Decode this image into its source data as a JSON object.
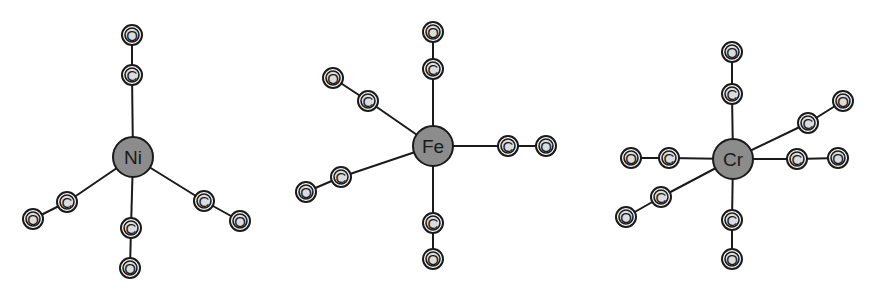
{
  "diagram": {
    "colors": {
      "metal_fill": "#8c8c8c",
      "ligand_fill": "#dcdcdc",
      "outline": "#1a1a1a",
      "background": "#ffffff"
    },
    "molecules": [
      {
        "name": "nickel-tetracarbonyl",
        "metal": {
          "label": "Ni",
          "x": 133,
          "y": 157,
          "r": 20
        },
        "ligands": [
          {
            "c": {
              "label": "C",
              "x": 132,
              "y": 75
            },
            "o": {
              "label": "O",
              "x": 132,
              "y": 35
            }
          },
          {
            "c": {
              "label": "C",
              "x": 67,
              "y": 202
            },
            "o": {
              "label": "O",
              "x": 33,
              "y": 219
            }
          },
          {
            "c": {
              "label": "C",
              "x": 131,
              "y": 228
            },
            "o": {
              "label": "O",
              "x": 130,
              "y": 268
            }
          },
          {
            "c": {
              "label": "C",
              "x": 204,
              "y": 201
            },
            "o": {
              "label": "O",
              "x": 240,
              "y": 221
            }
          }
        ]
      },
      {
        "name": "iron-pentacarbonyl",
        "metal": {
          "label": "Fe",
          "x": 433,
          "y": 146,
          "r": 20
        },
        "ligands": [
          {
            "c": {
              "label": "C",
              "x": 433,
              "y": 69
            },
            "o": {
              "label": "O",
              "x": 433,
              "y": 32
            }
          },
          {
            "c": {
              "label": "C",
              "x": 368,
              "y": 101
            },
            "o": {
              "label": "O",
              "x": 333,
              "y": 78
            }
          },
          {
            "c": {
              "label": "C",
              "x": 341,
              "y": 177
            },
            "o": {
              "label": "O",
              "x": 306,
              "y": 192
            }
          },
          {
            "c": {
              "label": "C",
              "x": 508,
              "y": 146
            },
            "o": {
              "label": "O",
              "x": 546,
              "y": 146
            }
          },
          {
            "c": {
              "label": "C",
              "x": 433,
              "y": 223
            },
            "o": {
              "label": "O",
              "x": 433,
              "y": 259
            }
          }
        ]
      },
      {
        "name": "chromium-hexacarbonyl",
        "metal": {
          "label": "Cr",
          "x": 733,
          "y": 159,
          "r": 20
        },
        "ligands": [
          {
            "c": {
              "label": "C",
              "x": 732,
              "y": 94
            },
            "o": {
              "label": "O",
              "x": 732,
              "y": 52
            }
          },
          {
            "c": {
              "label": "C",
              "x": 808,
              "y": 123
            },
            "o": {
              "label": "O",
              "x": 843,
              "y": 101
            }
          },
          {
            "c": {
              "label": "C",
              "x": 669,
              "y": 158
            },
            "o": {
              "label": "O",
              "x": 631,
              "y": 158
            }
          },
          {
            "c": {
              "label": "C",
              "x": 797,
              "y": 159
            },
            "o": {
              "label": "O",
              "x": 838,
              "y": 158
            }
          },
          {
            "c": {
              "label": "C",
              "x": 661,
              "y": 197
            },
            "o": {
              "label": "O",
              "x": 626,
              "y": 217
            }
          },
          {
            "c": {
              "label": "C",
              "x": 732,
              "y": 220
            },
            "o": {
              "label": "O",
              "x": 732,
              "y": 259
            }
          }
        ]
      }
    ]
  }
}
